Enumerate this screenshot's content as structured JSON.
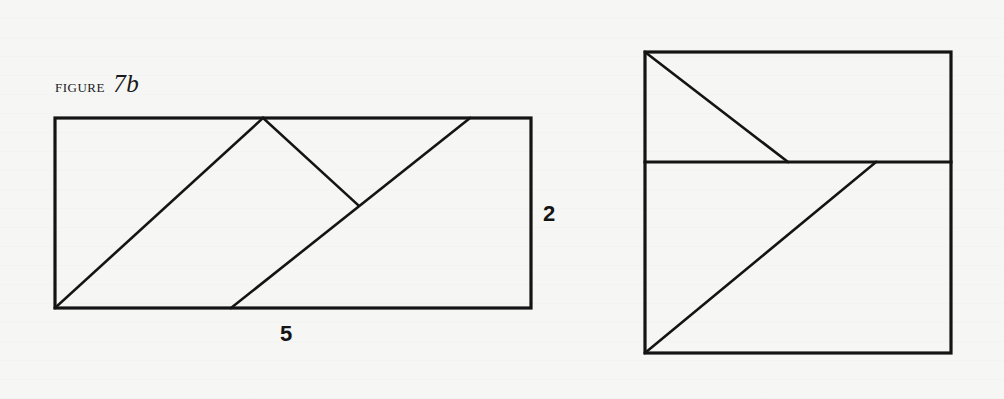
{
  "caption": {
    "prefix": "figure",
    "number": "7b"
  },
  "left_figure": {
    "rectangle": {
      "x1": 55,
      "y1": 118,
      "x2": 531,
      "y2": 308
    },
    "lines": [
      {
        "name": "diagonal-1",
        "x1": 55,
        "y1": 308,
        "x2": 263,
        "y2": 118
      },
      {
        "name": "perpendicular",
        "x1": 263,
        "y1": 118,
        "x2": 358,
        "y2": 205
      },
      {
        "name": "diagonal-2",
        "x1": 231,
        "y1": 308,
        "x2": 470,
        "y2": 118
      }
    ],
    "labels": {
      "height": "2",
      "width": "5"
    }
  },
  "right_figure": {
    "rectangle": {
      "x1": 645,
      "y1": 52,
      "x2": 951,
      "y2": 353
    },
    "lines": [
      {
        "name": "divider",
        "x1": 645,
        "y1": 162,
        "x2": 951,
        "y2": 162
      },
      {
        "name": "upper-diagonal",
        "x1": 645,
        "y1": 52,
        "x2": 788,
        "y2": 162
      },
      {
        "name": "lower-diagonal",
        "x1": 876,
        "y1": 162,
        "x2": 645,
        "y2": 353
      }
    ]
  },
  "style": {
    "stroke": "#141414",
    "background": "#f6f6f5"
  }
}
